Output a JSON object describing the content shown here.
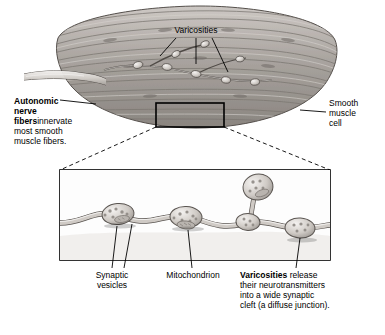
{
  "figure": {
    "labels": {
      "varicosities_top": "Varicosities",
      "autonomic_nerve_fibers": "Autonomic\nnerve fibers\ninnervate\nmost smooth\nmuscle fibers.",
      "autonomic_nerve_fibers_bold": "Autonomic\nnerve fibers",
      "autonomic_nerve_fibers_rest": "innervate\nmost smooth\nmuscle fibers.",
      "smooth_muscle_cell": "Smooth\nmuscle\ncell",
      "synaptic_vesicles": "Synaptic\nvesicles",
      "mitochondrion": "Mitochondrion",
      "varicosities_release_bold": "Varicosities",
      "varicosities_release_rest": " release\ntheir neurotransmitters\ninto a wide synaptic\ncleft (a diffuse junction)."
    },
    "colors": {
      "muscle_fill": "#b7b2ae",
      "muscle_dark": "#8d8883",
      "muscle_light": "#d9d5d1",
      "axon_fill": "#cfcac5",
      "axon_light": "#eceae7",
      "outline": "#000000",
      "background": "#ffffff",
      "leader_line": "#000000"
    }
  }
}
